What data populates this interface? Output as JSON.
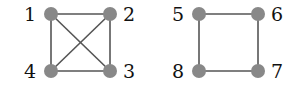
{
  "diagram": {
    "colors": {
      "node": "#888888",
      "edge": "#555555",
      "label": "#111111",
      "background": "#ffffff"
    },
    "graphs": [
      {
        "name": "complete-graph-k4",
        "nodes": [
          {
            "id": "1",
            "label": "1",
            "x": 51,
            "y": 14,
            "lx": 24,
            "ly": 21
          },
          {
            "id": "2",
            "label": "2",
            "x": 110,
            "y": 14,
            "lx": 123,
            "ly": 21
          },
          {
            "id": "3",
            "label": "3",
            "x": 110,
            "y": 71,
            "lx": 123,
            "ly": 78
          },
          {
            "id": "4",
            "label": "4",
            "x": 51,
            "y": 71,
            "lx": 24,
            "ly": 78
          }
        ],
        "edges": [
          [
            "1",
            "2"
          ],
          [
            "2",
            "3"
          ],
          [
            "3",
            "4"
          ],
          [
            "4",
            "1"
          ],
          [
            "1",
            "3"
          ],
          [
            "2",
            "4"
          ]
        ]
      },
      {
        "name": "cycle-graph-c4",
        "nodes": [
          {
            "id": "5",
            "label": "5",
            "x": 199,
            "y": 14,
            "lx": 172,
            "ly": 21
          },
          {
            "id": "6",
            "label": "6",
            "x": 258,
            "y": 14,
            "lx": 271,
            "ly": 21
          },
          {
            "id": "7",
            "label": "7",
            "x": 258,
            "y": 71,
            "lx": 271,
            "ly": 78
          },
          {
            "id": "8",
            "label": "8",
            "x": 199,
            "y": 71,
            "lx": 172,
            "ly": 78
          }
        ],
        "edges": [
          [
            "5",
            "6"
          ],
          [
            "6",
            "7"
          ],
          [
            "7",
            "8"
          ],
          [
            "8",
            "5"
          ]
        ]
      }
    ]
  }
}
